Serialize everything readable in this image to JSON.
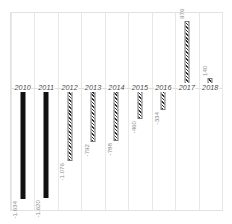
{
  "chart_data": {
    "type": "bar",
    "title": "",
    "subtitle": "",
    "xlabel": "",
    "ylabel": "",
    "orientation": "vertical",
    "grid": true,
    "legend": "none",
    "ylim": [
      -1800,
      1100
    ],
    "categories": [
      "2010",
      "2011",
      "2012",
      "2013",
      "2014",
      "2015",
      "2016",
      "2017",
      "2018"
    ],
    "values": [
      -1634,
      -1620,
      -1076,
      -792,
      -788,
      -460,
      -334,
      976,
      140
    ],
    "value_labels": [
      "-1.634",
      "-1.620",
      "-1.076",
      "-792",
      "-788",
      "-460",
      "-334",
      "976",
      "140"
    ],
    "bar_styles": [
      "solid",
      "solid",
      "hatch",
      "hatch",
      "hatch",
      "hatch",
      "hatch",
      "hatch",
      "hatch"
    ],
    "colors": {
      "solid_bar": "#111111",
      "hatch_bar": "#2b2b2b",
      "gridline": "#e8e8e8",
      "frame": "#e2e2e2",
      "year_label": "#4a4a4a",
      "value_label": "#8d8d8d",
      "background": "#ffffff"
    }
  }
}
